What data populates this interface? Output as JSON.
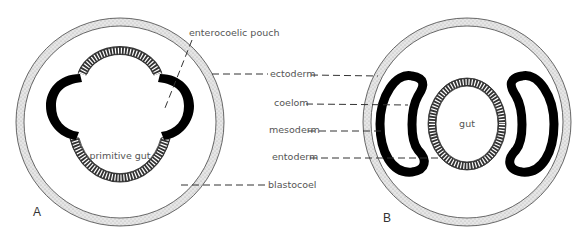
{
  "figure": {
    "panels": [
      {
        "id": "A",
        "label": "A",
        "inner_label": "primitive gut"
      },
      {
        "id": "B",
        "label": "B",
        "inner_label": "gut"
      }
    ],
    "labels": {
      "enterocoelic_pouch": "enterocoelic pouch",
      "ectoderm": "ectoderm",
      "coelom": "coelom",
      "mesoderm": "mesoderm",
      "entoderm": "entoderm",
      "blastocoel": "blastocoel"
    },
    "colors": {
      "ectoderm_fill": "#dcdcdc",
      "mesoderm_fill": "#000000",
      "outline": "#444444",
      "text": "#555555"
    }
  }
}
